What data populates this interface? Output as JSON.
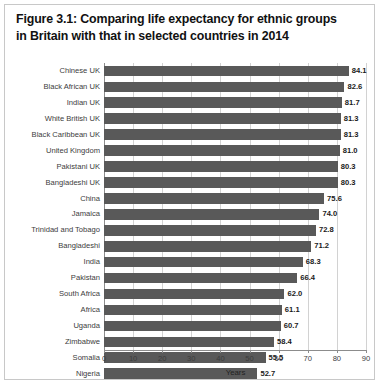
{
  "figure": {
    "title_lines": [
      "Figure 3.1: Comparing life expectancy for ethnic groups",
      "in Britain with that in selected countries in 2014"
    ],
    "border_color": "#c8c8c8",
    "background": "#ffffff"
  },
  "chart_data": {
    "type": "bar",
    "orientation": "horizontal",
    "title": "Figure 3.1: Comparing life expectancy for ethnic groups in Britain with that in selected countries in 2014",
    "xlabel": "Years",
    "ylabel": "",
    "xlim": [
      0,
      90
    ],
    "xticks": [
      0,
      10,
      20,
      30,
      40,
      50,
      60,
      70,
      80,
      90
    ],
    "grid": "vertical",
    "legend": "none",
    "bar_color": "#595959",
    "gridline_color": "#d2d2d2",
    "axis_color": "#8c8c8c",
    "categories": [
      "Chinese UK",
      "Black African UK",
      "Indian UK",
      "White British UK",
      "Black Caribbean UK",
      "United Kingdom",
      "Pakistani UK",
      "Bangladeshi UK",
      "China",
      "Jamaica",
      "Trinidad and Tobago",
      "Bangladeshi",
      "India",
      "Pakistan",
      "South Africa",
      "Africa",
      "Uganda",
      "Zimbabwe",
      "Somalia",
      "Nigeria"
    ],
    "values": [
      84.1,
      82.6,
      81.7,
      81.3,
      81.3,
      81.0,
      80.3,
      80.3,
      75.6,
      74.0,
      72.8,
      71.2,
      68.3,
      66.4,
      62.0,
      61.1,
      60.7,
      58.4,
      55.5,
      52.7
    ],
    "value_labels": [
      "84.1",
      "82.6",
      "81.7",
      "81.3",
      "81.3",
      "81.0",
      "80.3",
      "80.3",
      "75.6",
      "74.0",
      "72.8",
      "71.2",
      "68.3",
      "66.4",
      "62.0",
      "61.1",
      "60.7",
      "58.4",
      "55.5",
      "52.7"
    ],
    "tick_labels": [
      "0",
      "10",
      "20",
      "30",
      "40",
      "50",
      "60",
      "70",
      "80",
      "90"
    ]
  }
}
